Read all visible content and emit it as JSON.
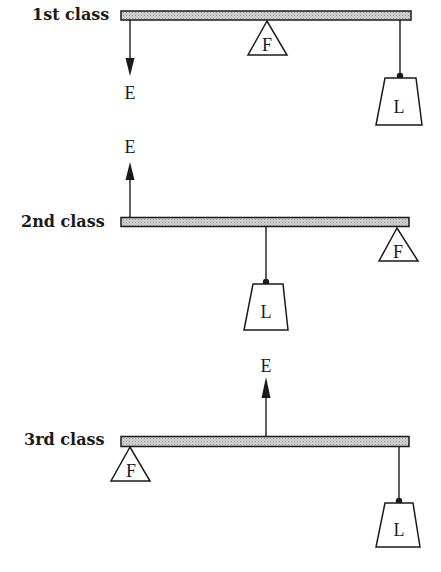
{
  "figure": {
    "legend": {
      "E": "Effort",
      "F": "Fulcrum",
      "L": "Load"
    },
    "levers": [
      {
        "label": "1st class",
        "effort_label": "E",
        "effort_direction": "down",
        "fulcrum_label": "F",
        "load_label": "L",
        "order_left_to_right": [
          "E",
          "F",
          "L"
        ]
      },
      {
        "label": "2nd class",
        "effort_label": "E",
        "effort_direction": "up",
        "fulcrum_label": "F",
        "load_label": "L",
        "order_left_to_right": [
          "E",
          "L",
          "F"
        ]
      },
      {
        "label": "3rd class",
        "effort_label": "E",
        "effort_direction": "up",
        "fulcrum_label": "F",
        "load_label": "L",
        "order_left_to_right": [
          "F",
          "E",
          "L"
        ]
      }
    ]
  }
}
